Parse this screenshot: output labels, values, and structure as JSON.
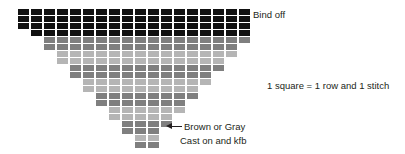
{
  "diagram": {
    "type": "knitting-stitch-chart",
    "grid": {
      "cell_width_px": 11,
      "cell_height_px": 6,
      "cell_gap_px": 2,
      "origin_x_px": 18,
      "origin_y_px": 9,
      "total_rows": 18,
      "top_row_stitches": 18,
      "bottom_row_stitches": 2,
      "shape": "inverted-triangle",
      "decrease_per_row": 1,
      "decrease_side": "both-ends-alternating"
    },
    "colors": {
      "bind_off": "#111111",
      "dark_gray": "#7f7f7f",
      "light_gray": "#b5b5b5",
      "background": "#ffffff",
      "text": "#231f20"
    },
    "rows": [
      {
        "index": 1,
        "stitches": 18,
        "offset": 0,
        "color": "#111111"
      },
      {
        "index": 2,
        "stitches": 18,
        "offset": 0,
        "color": "#111111"
      },
      {
        "index": 3,
        "stitches": 18,
        "offset": 0,
        "color": "#111111"
      },
      {
        "index": 4,
        "stitches": 17,
        "offset": 1,
        "color": "#111111"
      },
      {
        "index": 5,
        "stitches": 16,
        "offset": 2,
        "color": "#7f7f7f"
      },
      {
        "index": 6,
        "stitches": 15,
        "offset": 2,
        "color": "#7f7f7f"
      },
      {
        "index": 7,
        "stitches": 14,
        "offset": 3,
        "color": "#b5b5b5"
      },
      {
        "index": 8,
        "stitches": 13,
        "offset": 3,
        "color": "#b5b5b5"
      },
      {
        "index": 9,
        "stitches": 12,
        "offset": 4,
        "color": "#7f7f7f"
      },
      {
        "index": 10,
        "stitches": 11,
        "offset": 4,
        "color": "#7f7f7f"
      },
      {
        "index": 11,
        "stitches": 10,
        "offset": 5,
        "color": "#b5b5b5"
      },
      {
        "index": 12,
        "stitches": 9,
        "offset": 5,
        "color": "#b5b5b5"
      },
      {
        "index": 13,
        "stitches": 8,
        "offset": 6,
        "color": "#7f7f7f"
      },
      {
        "index": 14,
        "stitches": 7,
        "offset": 6,
        "color": "#7f7f7f"
      },
      {
        "index": 15,
        "stitches": 6,
        "offset": 7,
        "color": "#b5b5b5"
      },
      {
        "index": 16,
        "stitches": 5,
        "offset": 7,
        "color": "#b5b5b5"
      },
      {
        "index": 17,
        "stitches": 4,
        "offset": 8,
        "color": "#7f7f7f"
      },
      {
        "index": 18,
        "stitches": 3,
        "offset": 8,
        "color": "#7f7f7f"
      },
      {
        "index": 19,
        "stitches": 2,
        "offset": 9,
        "color": "#b5b5b5"
      },
      {
        "index": 20,
        "stitches": 2,
        "offset": 9,
        "color": "#7f7f7f"
      }
    ]
  },
  "labels": {
    "bind_off": "Bind off",
    "legend_scale": "1 square = 1 row and 1 stitch",
    "brown_or_gray": "Brown or Gray",
    "cast_on": "Cast on and kfb",
    "arrow_icon": "arrow-left-icon"
  }
}
